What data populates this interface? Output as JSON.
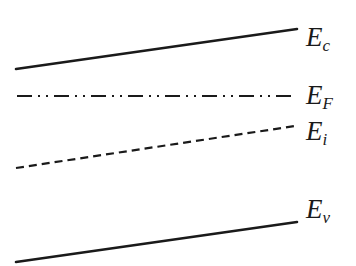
{
  "diagram": {
    "title": "",
    "type": "energy-band-diagram",
    "line_color": "#1a1a1a",
    "background": "#ffffff",
    "levels": [
      {
        "id": "conduction-band",
        "label_main": "E",
        "label_sub": "c",
        "style": "solid",
        "x1": 16,
        "y1": 69,
        "x2": 297,
        "y2": 29,
        "label_x": 306,
        "label_y": 46
      },
      {
        "id": "fermi-level",
        "label_main": "E",
        "label_sub": "F",
        "style": "dash-dot-dot",
        "x1": 17,
        "y1": 96,
        "x2": 293,
        "y2": 96,
        "label_x": 306,
        "label_y": 104
      },
      {
        "id": "intrinsic-level",
        "label_main": "E",
        "label_sub": "i",
        "style": "dashed",
        "x1": 16,
        "y1": 168,
        "x2": 295,
        "y2": 126,
        "label_x": 306,
        "label_y": 140
      },
      {
        "id": "valence-band",
        "label_main": "E",
        "label_sub": "v",
        "style": "solid",
        "x1": 16,
        "y1": 262,
        "x2": 297,
        "y2": 222,
        "label_x": 306,
        "label_y": 218
      }
    ]
  }
}
